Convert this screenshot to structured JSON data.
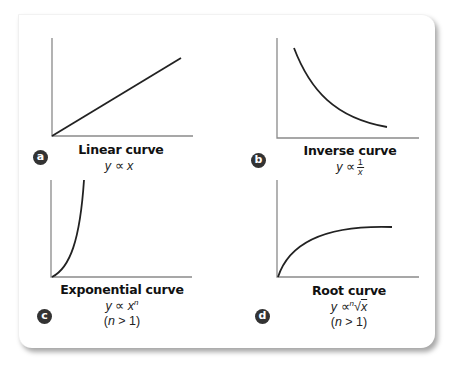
{
  "panels": [
    {
      "id": "a",
      "badge": "a",
      "title": "Linear curve",
      "formula": {
        "lhs": "y",
        "relation": "∝",
        "rhs": "x"
      },
      "condition": null,
      "curve_type": "linear"
    },
    {
      "id": "b",
      "badge": "b",
      "title": "Inverse curve",
      "formula": {
        "lhs": "y",
        "relation": "∝",
        "numerator": "1",
        "denominator": "x"
      },
      "condition": null,
      "curve_type": "inverse"
    },
    {
      "id": "c",
      "badge": "c",
      "title": "Exponential curve",
      "formula": {
        "lhs": "y",
        "relation": "∝",
        "base": "x",
        "exponent": "n"
      },
      "condition": {
        "open": "(",
        "var": "n",
        "rest": " > 1)"
      },
      "curve_type": "exponential"
    },
    {
      "id": "d",
      "badge": "d",
      "title": "Root curve",
      "formula": {
        "lhs": "y",
        "relation": "∝",
        "index": "n",
        "radical": "√",
        "radicand": "x"
      },
      "condition": {
        "open": "(",
        "var": "n",
        "rest": " > 1)"
      },
      "curve_type": "root"
    }
  ],
  "colors": {
    "axis": "#8a8a8a",
    "curve": "#222222",
    "badge_bg": "#333333",
    "badge_text": "#ffffff",
    "card_bg": "#ffffff"
  }
}
